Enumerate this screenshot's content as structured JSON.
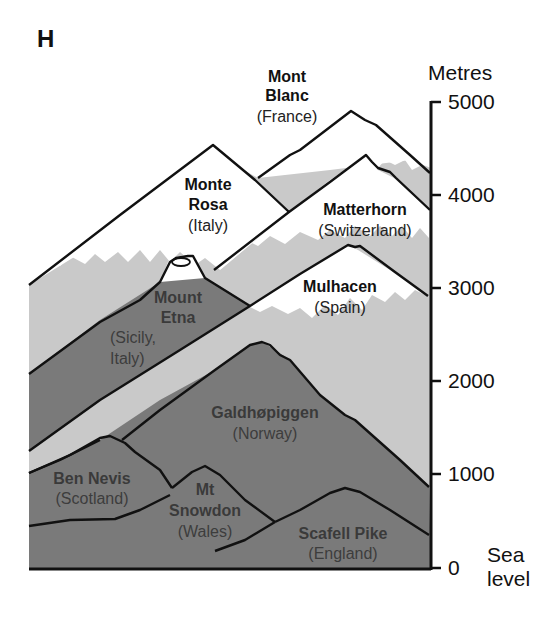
{
  "panel_label": "H",
  "axis": {
    "unit_label": "Metres",
    "ticks": [
      "5000",
      "4000",
      "3000",
      "2000",
      "1000",
      "0"
    ],
    "sea_label_line1": "Sea",
    "sea_label_line2": "level"
  },
  "colors": {
    "snow": "#ffffff",
    "light_grey": "#c9c9c9",
    "dark_grey": "#7a7a7a",
    "outline": "#111111"
  },
  "mountains": [
    {
      "name_line1": "Mont",
      "name_line2": "Blanc",
      "country": "(France)",
      "height_m": 4807
    },
    {
      "name_line1": "Monte",
      "name_line2": "Rosa",
      "country": "(Italy)",
      "height_m": 4634
    },
    {
      "name_line1": "Matterhorn",
      "country": "(Switzerland)",
      "height_m": 4478
    },
    {
      "name_line1": "Mulhacen",
      "country": "(Spain)",
      "height_m": 3479
    },
    {
      "name_line1": "Mount",
      "name_line2": "Etna",
      "country_line1": "(Sicily,",
      "country_line2": "Italy)",
      "height_m": 3350
    },
    {
      "name_line1": "Galdhøpiggen",
      "country": "(Norway)",
      "height_m": 2469
    },
    {
      "name_line1": "Ben Nevis",
      "country": "(Scotland)",
      "height_m": 1345
    },
    {
      "name_line1": "Mt",
      "name_line2": "Snowdon",
      "country": "(Wales)",
      "height_m": 1085
    },
    {
      "name_line1": "Scafell Pike",
      "country": "(England)",
      "height_m": 978
    }
  ]
}
